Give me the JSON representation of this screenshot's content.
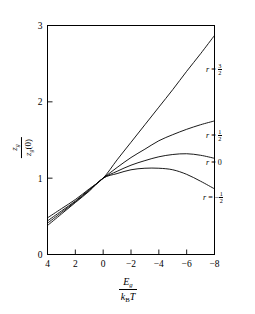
{
  "figure": {
    "background_color": "#ffffff",
    "line_color": "#000000"
  },
  "axes": {
    "y": {
      "label_numerator": "z",
      "label_numerator_sub": "g",
      "label_denominator": "z",
      "label_denominator_sub": "g",
      "label_denominator_arg": "(0)",
      "ticks": [
        "0",
        "1",
        "2",
        "3"
      ],
      "tick_values": [
        0,
        1,
        2,
        3
      ],
      "range": [
        0,
        3
      ]
    },
    "x": {
      "label_numerator": "E",
      "label_numerator_sub": "g",
      "label_denominator_k": "k",
      "label_denominator_sub": "B",
      "label_denominator_T": "T",
      "ticks": [
        "4",
        "2",
        "0",
        "−2",
        "−4",
        "−6",
        "−8"
      ],
      "tick_values": [
        4,
        2,
        0,
        -2,
        -4,
        -6,
        -8
      ],
      "range": [
        4,
        -8
      ],
      "reversed": true
    }
  },
  "curve_labels": [
    {
      "id": "r-three-halves",
      "prefix": "r",
      "eq": "=",
      "sign": "",
      "num": "3",
      "den": "2",
      "text": "r = 3/2",
      "x": 206,
      "y": 63
    },
    {
      "id": "r-one-half",
      "prefix": "r",
      "eq": "=",
      "sign": "",
      "num": "1",
      "den": "2",
      "text": "r = 1/2",
      "x": 206,
      "y": 129
    },
    {
      "id": "r-zero",
      "prefix": "r",
      "eq": "=",
      "sign": "",
      "num": "0",
      "den": "",
      "text": "r = 0",
      "x": 206,
      "y": 158
    },
    {
      "id": "r-minus-one-half",
      "prefix": "r",
      "eq": "=",
      "sign": "−",
      "num": "1",
      "den": "2",
      "text": "r = −1/2",
      "x": 203,
      "y": 191
    }
  ],
  "chart_data": {
    "type": "line",
    "title": "",
    "xlabel": "E_g / (k_B T)",
    "ylabel": "z_g / z_g(0)",
    "xlim": [
      4,
      -8
    ],
    "ylim": [
      0,
      3
    ],
    "xticks": [
      4,
      2,
      0,
      -2,
      -4,
      -6,
      -8
    ],
    "yticks": [
      0,
      1,
      2,
      3
    ],
    "grid": false,
    "legend": "inline-right-of-curves",
    "x": [
      4,
      3,
      2,
      1,
      0,
      -1,
      -2,
      -3,
      -4,
      -5,
      -6,
      -7,
      -8
    ],
    "series": [
      {
        "name": "r = 3/2",
        "r": 1.5,
        "values": [
          0.48,
          0.6,
          0.72,
          0.86,
          1.0,
          1.24,
          1.47,
          1.7,
          1.93,
          2.16,
          2.4,
          2.63,
          2.87
        ]
      },
      {
        "name": "r = 1/2",
        "r": 0.5,
        "values": [
          0.44,
          0.57,
          0.7,
          0.85,
          1.0,
          1.14,
          1.27,
          1.38,
          1.49,
          1.57,
          1.64,
          1.7,
          1.75
        ]
      },
      {
        "name": "r = 0",
        "r": 0.0,
        "values": [
          0.41,
          0.55,
          0.69,
          0.84,
          1.0,
          1.09,
          1.17,
          1.23,
          1.28,
          1.31,
          1.32,
          1.3,
          1.26
        ]
      },
      {
        "name": "r = -1/2",
        "r": -0.5,
        "values": [
          0.38,
          0.53,
          0.68,
          0.83,
          1.0,
          1.06,
          1.11,
          1.13,
          1.13,
          1.11,
          1.05,
          0.96,
          0.86
        ]
      }
    ]
  }
}
